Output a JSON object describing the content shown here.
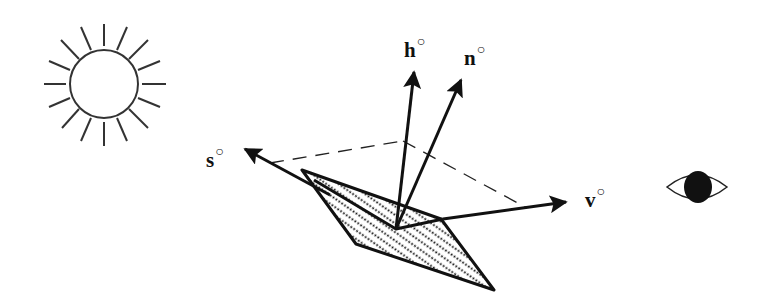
{
  "diagram": {
    "title": "",
    "colors": {
      "stroke": "#111111",
      "background": "#ffffff"
    },
    "labels": {
      "h": {
        "symbol": "h",
        "mark": "○"
      },
      "n": {
        "symbol": "n",
        "mark": "○"
      },
      "s": {
        "symbol": "s",
        "mark": "○"
      },
      "v": {
        "symbol": "v",
        "mark": "○"
      }
    },
    "elements": [
      {
        "name": "sun-icon",
        "meaning": "light source"
      },
      {
        "name": "eye-icon",
        "meaning": "viewer"
      },
      {
        "name": "surface-patch",
        "meaning": "hatched surface element"
      },
      {
        "name": "vector-s",
        "meaning": "direction to source"
      },
      {
        "name": "vector-h",
        "meaning": "halfway vector"
      },
      {
        "name": "vector-n",
        "meaning": "surface normal"
      },
      {
        "name": "vector-v",
        "meaning": "direction to viewer"
      }
    ]
  }
}
